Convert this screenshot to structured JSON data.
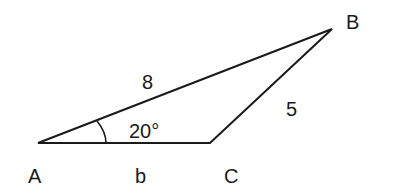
{
  "diagram": {
    "type": "triangle",
    "vertices": {
      "A": {
        "label": "A",
        "x": 38,
        "y": 143
      },
      "B": {
        "label": "B",
        "x": 332,
        "y": 29
      },
      "C": {
        "label": "C",
        "x": 210,
        "y": 143
      }
    },
    "sides": {
      "AB": {
        "label": "8"
      },
      "BC": {
        "label": "5"
      },
      "AC": {
        "label": "b"
      }
    },
    "angle_A": {
      "label": "20°"
    },
    "stroke_color": "#1a1a1a"
  }
}
